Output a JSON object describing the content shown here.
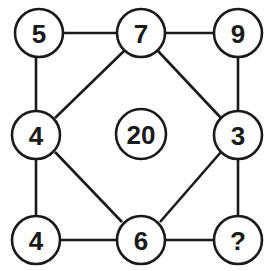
{
  "puzzle": {
    "nodes": {
      "top_left": "5",
      "top_center": "7",
      "top_right": "9",
      "middle_left": "4",
      "center": "20",
      "middle_right": "3",
      "bottom_left": "4",
      "bottom_center": "6",
      "bottom_right": "?"
    },
    "colors": {
      "stroke": "#1a1a1a",
      "fill": "#ffffff"
    }
  }
}
